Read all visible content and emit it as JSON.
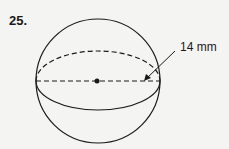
{
  "problem": {
    "number": "25.",
    "figure": "sphere",
    "measurement_label": "14 mm",
    "measurement_type": "radius"
  },
  "colors": {
    "ink": "#1a1a1a",
    "background": "#f4f4f2"
  }
}
